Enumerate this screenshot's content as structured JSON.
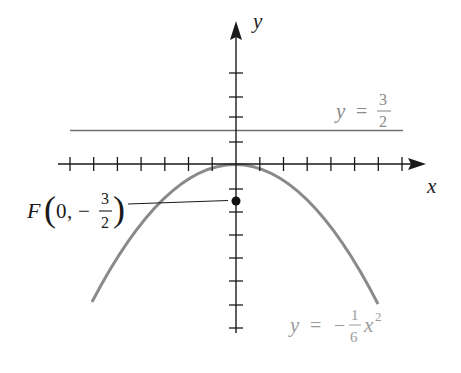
{
  "figure": {
    "type": "parabola-with-focus-and-directrix",
    "colors": {
      "axes": "#1a1a1a",
      "curve": "#8a8a8a",
      "directrix": "#6f6f6f",
      "curve_label": "#9a9a9a",
      "directrix_label": "#8a8a8a",
      "focus_point": "#111111",
      "background": "#ffffff"
    },
    "axes": {
      "x_label": "x",
      "y_label": "y",
      "x_ticks": [
        -7,
        -6,
        -5,
        -4,
        -3,
        -2,
        -1,
        1,
        2,
        3,
        4,
        5,
        6,
        7
      ],
      "y_ticks": [
        4,
        3,
        2,
        1,
        -1,
        -2,
        -3,
        -4,
        -5,
        -6,
        -7
      ]
    },
    "directrix": {
      "equation_lhs": "y",
      "equals": "=",
      "numerator": "3",
      "denominator": "2",
      "y_value": 1.5
    },
    "focus": {
      "name": "F",
      "x": "0",
      "minus": "−",
      "numerator": "3",
      "denominator": "2",
      "comma": ",",
      "y_value": -1.5
    },
    "curve": {
      "equation_lhs": "y",
      "equals": "=",
      "minus": "−",
      "numerator": "1",
      "denominator": "6",
      "variable": "x",
      "exponent": "2",
      "coefficient": -0.16667
    }
  }
}
